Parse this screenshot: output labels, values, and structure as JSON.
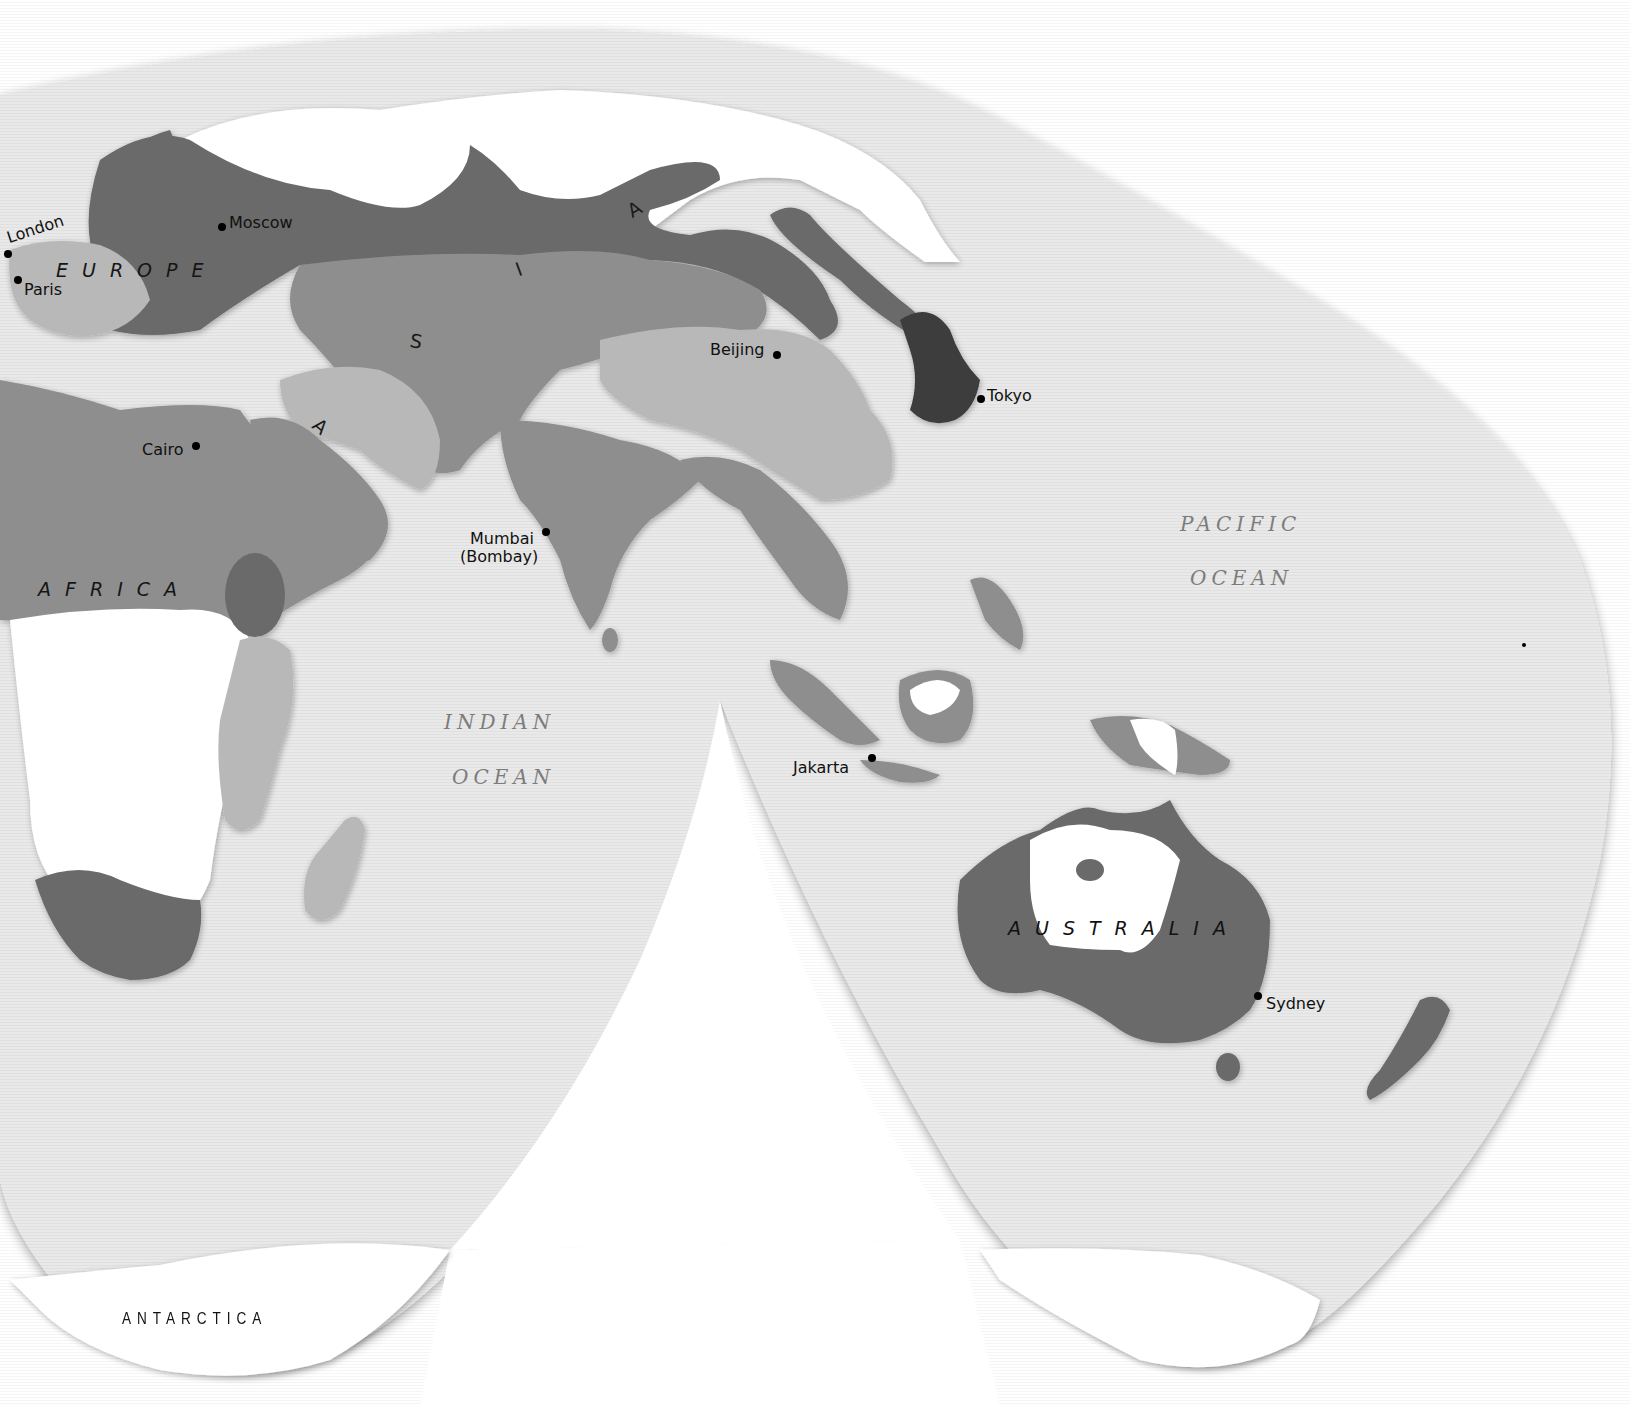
{
  "map": {
    "projection": "interrupted (Goode-style) world map, Eastern Hemisphere lobes",
    "colors": {
      "ocean": "#e9e9e9",
      "ocean_edge_shadow": "#c9c9c9",
      "background": "#ffffff",
      "class_white": "#ffffff",
      "class_light": "#b8b8b8",
      "class_medium": "#8e8e8e",
      "class_dark": "#6a6a6a",
      "class_darkest": "#3c3c3c",
      "label_text": "#111111",
      "ocean_label_text": "#7c7c7c"
    },
    "continents": {
      "europe": "EUROPE",
      "asia_letters": [
        "A",
        "I",
        "S",
        "A"
      ],
      "africa": "AFRICA",
      "australia": "AUSTRALIA",
      "antarctica": "ANTARCTICA"
    },
    "oceans": {
      "pacific_line1": "PACIFIC",
      "pacific_line2": "OCEAN",
      "indian_line1": "INDIAN",
      "indian_line2": "OCEAN"
    },
    "cities": [
      {
        "name": "London",
        "x": 8,
        "y": 246
      },
      {
        "name": "Paris",
        "x": 18,
        "y": 280
      },
      {
        "name": "Moscow",
        "x": 222,
        "y": 227
      },
      {
        "name": "Cairo",
        "x": 196,
        "y": 446
      },
      {
        "name": "Mumbai",
        "sub": "(Bombay)",
        "x": 546,
        "y": 532
      },
      {
        "name": "Beijing",
        "x": 777,
        "y": 355
      },
      {
        "name": "Tokyo",
        "x": 981,
        "y": 399
      },
      {
        "name": "Jakarta",
        "x": 872,
        "y": 758
      },
      {
        "name": "Sydney",
        "x": 1258,
        "y": 996
      }
    ]
  }
}
